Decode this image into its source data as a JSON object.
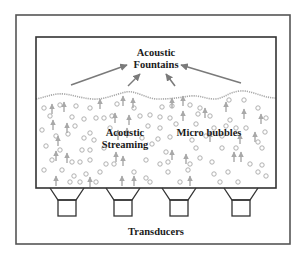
{
  "diagram": {
    "colors": {
      "frame": "#555555",
      "tank": "#333333",
      "gray": "#a8a8a8",
      "arrow": "#7a7a7a",
      "text": "#1a1a1a"
    },
    "outer_frame": {
      "x": 16,
      "y": 15,
      "w": 274,
      "h": 229
    },
    "tank": {
      "x": 36,
      "y": 37,
      "w": 240,
      "h": 151
    },
    "labels": {
      "fountains_line1": "Acoustic",
      "fountains_line2": "Fountains",
      "streaming_line1": "Acoustic",
      "streaming_line2": "Streaming",
      "bubbles": "Micro bubbles",
      "transducers": "Transducers"
    },
    "fountain_arrows": [
      {
        "x1": 71,
        "y1": 85,
        "x2": 127,
        "y2": 65
      },
      {
        "x1": 128,
        "y1": 86,
        "x2": 140,
        "y2": 74
      },
      {
        "x1": 175,
        "y1": 86,
        "x2": 166,
        "y2": 74
      },
      {
        "x1": 241,
        "y1": 83,
        "x2": 181,
        "y2": 65
      }
    ],
    "surface_wave": "M36,99 C46,97 54,93 64,94 C74,95 80,98 92,99 C104,100 116,94 126,92 C136,90 146,99 158,99 C172,99 176,98 190,96 C200,95 206,99 214,99 C224,99 228,92 240,91 C252,90 262,98 276,98",
    "transducers": [
      {
        "cx": 67
      },
      {
        "cx": 123
      },
      {
        "cx": 179
      },
      {
        "cx": 241
      }
    ],
    "streaming_arrows": [
      [
        52,
        110
      ],
      [
        64,
        108
      ],
      [
        100,
        105
      ],
      [
        123,
        102
      ],
      [
        133,
        104
      ],
      [
        172,
        104
      ],
      [
        183,
        102
      ],
      [
        226,
        108
      ],
      [
        53,
        126
      ],
      [
        67,
        129
      ],
      [
        115,
        119
      ],
      [
        129,
        121
      ],
      [
        183,
        117
      ],
      [
        205,
        114
      ],
      [
        244,
        115
      ],
      [
        261,
        120
      ],
      [
        58,
        142
      ],
      [
        118,
        136
      ],
      [
        127,
        134
      ],
      [
        210,
        138
      ],
      [
        240,
        140
      ],
      [
        255,
        138
      ],
      [
        56,
        157
      ],
      [
        67,
        159
      ],
      [
        116,
        158
      ],
      [
        123,
        162
      ],
      [
        172,
        156
      ],
      [
        186,
        160
      ],
      [
        234,
        158
      ],
      [
        241,
        158
      ],
      [
        90,
        183
      ],
      [
        122,
        182
      ],
      [
        134,
        182
      ],
      [
        190,
        182
      ],
      [
        56,
        182
      ]
    ],
    "bubbles": [
      [
        44,
        108
      ],
      [
        60,
        105
      ],
      [
        76,
        106
      ],
      [
        90,
        108
      ],
      [
        117,
        104
      ],
      [
        134,
        108
      ],
      [
        162,
        107
      ],
      [
        172,
        106
      ],
      [
        190,
        105
      ],
      [
        200,
        108
      ],
      [
        229,
        100
      ],
      [
        244,
        100
      ],
      [
        258,
        108
      ],
      [
        50,
        116
      ],
      [
        72,
        117
      ],
      [
        84,
        119
      ],
      [
        96,
        118
      ],
      [
        104,
        118
      ],
      [
        112,
        116
      ],
      [
        140,
        116
      ],
      [
        150,
        115
      ],
      [
        160,
        117
      ],
      [
        170,
        118
      ],
      [
        198,
        114
      ],
      [
        210,
        116
      ],
      [
        230,
        120
      ],
      [
        266,
        118
      ],
      [
        42,
        130
      ],
      [
        75,
        126
      ],
      [
        90,
        133
      ],
      [
        110,
        128
      ],
      [
        148,
        126
      ],
      [
        160,
        128
      ],
      [
        176,
        124
      ],
      [
        196,
        124
      ],
      [
        214,
        128
      ],
      [
        226,
        126
      ],
      [
        246,
        128
      ],
      [
        265,
        132
      ],
      [
        56,
        136
      ],
      [
        68,
        134
      ],
      [
        84,
        138
      ],
      [
        94,
        140
      ],
      [
        142,
        138
      ],
      [
        158,
        139
      ],
      [
        170,
        137
      ],
      [
        192,
        140
      ],
      [
        206,
        136
      ],
      [
        222,
        136
      ],
      [
        236,
        128
      ],
      [
        258,
        142
      ],
      [
        46,
        146
      ],
      [
        60,
        150
      ],
      [
        82,
        150
      ],
      [
        90,
        150
      ],
      [
        104,
        148
      ],
      [
        152,
        144
      ],
      [
        166,
        152
      ],
      [
        196,
        148
      ],
      [
        222,
        148
      ],
      [
        236,
        148
      ],
      [
        262,
        148
      ],
      [
        52,
        160
      ],
      [
        72,
        162
      ],
      [
        80,
        162
      ],
      [
        90,
        160
      ],
      [
        106,
        164
      ],
      [
        114,
        164
      ],
      [
        146,
        160
      ],
      [
        160,
        164
      ],
      [
        168,
        162
      ],
      [
        190,
        164
      ],
      [
        200,
        158
      ],
      [
        212,
        162
      ],
      [
        250,
        164
      ],
      [
        262,
        165
      ],
      [
        44,
        170
      ],
      [
        62,
        170
      ],
      [
        74,
        176
      ],
      [
        86,
        174
      ],
      [
        100,
        172
      ],
      [
        134,
        172
      ],
      [
        146,
        178
      ],
      [
        168,
        172
      ],
      [
        188,
        170
      ],
      [
        214,
        174
      ],
      [
        228,
        172
      ],
      [
        258,
        172
      ],
      [
        266,
        176
      ],
      [
        70,
        182
      ],
      [
        80,
        182
      ],
      [
        96,
        182
      ],
      [
        150,
        182
      ],
      [
        180,
        182
      ],
      [
        220,
        182
      ],
      [
        238,
        182
      ]
    ]
  }
}
